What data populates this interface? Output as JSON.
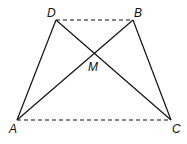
{
  "diagram": {
    "points": {
      "D": {
        "label": "D",
        "x": 56,
        "y": 20
      },
      "B": {
        "label": "B",
        "x": 133,
        "y": 20
      },
      "A": {
        "label": "A",
        "x": 17,
        "y": 120
      },
      "C": {
        "label": "C",
        "x": 171,
        "y": 120
      },
      "M": {
        "label": "M",
        "x": 94,
        "y": 54
      }
    },
    "solid_segments": [
      "AD",
      "BC",
      "AB",
      "DC"
    ],
    "dashed_segments": [
      "DB",
      "AC"
    ],
    "stroke_color": "#111111"
  }
}
